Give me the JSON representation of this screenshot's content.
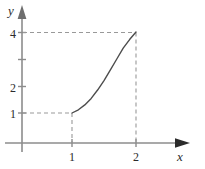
{
  "chart_data": {
    "type": "line",
    "title": "",
    "subtitle": "",
    "xlabel": "x",
    "ylabel": "y",
    "xlim": [
      0,
      2.6
    ],
    "ylim": [
      0,
      4.5
    ],
    "grid": false,
    "legend": null,
    "x_ticks": [
      {
        "value": 1,
        "label": "1"
      },
      {
        "value": 2,
        "label": "2"
      }
    ],
    "y_ticks": [
      {
        "value": 1,
        "label": "1"
      },
      {
        "value": 2,
        "label": "2"
      },
      {
        "value": 3,
        "label": ""
      },
      {
        "value": 4,
        "label": "4"
      }
    ],
    "series": [
      {
        "name": "curve",
        "color": "#4d4d4d",
        "x": [
          1.0,
          1.1,
          1.2,
          1.3,
          1.4,
          1.5,
          1.6,
          1.7,
          1.8,
          1.9,
          2.0
        ],
        "values": [
          1.0,
          1.12,
          1.3,
          1.54,
          1.85,
          2.2,
          2.6,
          3.0,
          3.4,
          3.72,
          4.0
        ]
      }
    ],
    "annotations": [
      {
        "type": "dashed-horizontal",
        "y": 1,
        "x_from": 0,
        "x_to": 1,
        "color": "#999999"
      },
      {
        "type": "dashed-horizontal",
        "y": 4,
        "x_from": 0,
        "x_to": 2,
        "color": "#999999"
      },
      {
        "type": "dashed-vertical",
        "x": 1,
        "y_from": 0,
        "y_to": 1,
        "color": "#999999"
      },
      {
        "type": "dashed-vertical",
        "x": 2,
        "y_from": 0,
        "y_to": 4,
        "color": "#999999"
      }
    ],
    "axis_color": "#8c8c8c",
    "curve_color": "#4d4d4d",
    "dash_color": "#999999",
    "background": "#ffffff",
    "points_of_interest": [
      {
        "x": 1,
        "y": 1
      },
      {
        "x": 2,
        "y": 4
      }
    ]
  }
}
